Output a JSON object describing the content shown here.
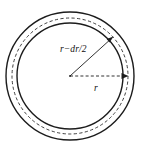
{
  "figure": {
    "kind": "annulus-radius-diagram",
    "background_color": "#ffffff",
    "line_color": "#1c1c1c",
    "canvas": {
      "width": 150,
      "height": 152
    },
    "center": {
      "x": 70,
      "y": 76
    },
    "circles": [
      {
        "name": "outer-boundary",
        "style": "solid",
        "radius": 64
      },
      {
        "name": "mid-dashed",
        "style": "dashed",
        "radius": 58
      },
      {
        "name": "inner-boundary",
        "style": "solid",
        "radius": 53
      }
    ],
    "labels": {
      "mean_radius": "r−dr/2",
      "radius": "r"
    },
    "leaders": [
      {
        "name": "mean-radius-leader",
        "style": "solid",
        "angle_deg": 39,
        "label": "r−dr/2",
        "arrowhead": "end"
      },
      {
        "name": "radius-leader",
        "style": "dashed",
        "angle_deg": 0,
        "label": "r",
        "arrowhead": "end"
      }
    ]
  }
}
